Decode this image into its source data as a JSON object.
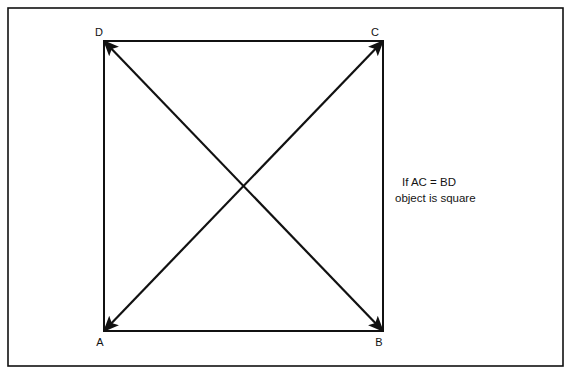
{
  "figure": {
    "name": "square-diagonals-diagram",
    "width": 572,
    "height": 377,
    "background_color": "#ffffff",
    "stroke_color": "#111111",
    "text_color": "#141414"
  },
  "frame": {
    "x": 8,
    "y": 8,
    "width": 555,
    "height": 358,
    "stroke_width": 1.6
  },
  "square": {
    "left": 104,
    "top": 41,
    "right": 383,
    "bottom": 331,
    "stroke_width": 2.0
  },
  "diagonals": {
    "stroke_width": 2.2,
    "arrowhead_length": 15,
    "arrowhead_half_width": 4.6,
    "lines": [
      {
        "name": "diagonal-ac",
        "from": "A",
        "to": "C",
        "x1": 104,
        "y1": 331,
        "x2": 383,
        "y2": 41,
        "double_headed": true
      },
      {
        "name": "diagonal-bd",
        "from": "B",
        "to": "D",
        "x1": 383,
        "y1": 331,
        "x2": 104,
        "y2": 41,
        "double_headed": true
      }
    ],
    "intersection": {
      "x": 243.5,
      "y": 186
    }
  },
  "vertices": [
    {
      "key": "D",
      "label": "D",
      "corner_x": 104,
      "corner_y": 41,
      "label_x": 99,
      "label_y": 36
    },
    {
      "key": "C",
      "label": "C",
      "corner_x": 383,
      "corner_y": 41,
      "label_x": 375,
      "label_y": 36
    },
    {
      "key": "A",
      "label": "A",
      "corner_x": 104,
      "corner_y": 331,
      "label_x": 100,
      "label_y": 346
    },
    {
      "key": "B",
      "label": "B",
      "corner_x": 383,
      "corner_y": 331,
      "label_x": 379,
      "label_y": 346
    }
  ],
  "annotation": {
    "name": "condition-note",
    "line1": "If AC  =  BD",
    "line2": "object is square",
    "line1_x": 402,
    "line1_y": 186,
    "line2_x": 395,
    "line2_y": 202
  }
}
